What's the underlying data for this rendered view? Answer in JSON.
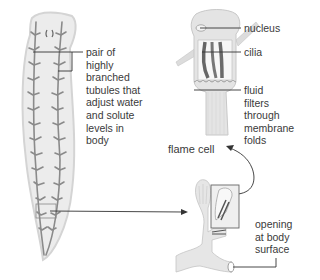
{
  "diagram": {
    "labels": {
      "tubules": "pair of\nhighly\nbranched\ntubules that\nadjust water\nand solute\nlevels in\nbody",
      "nucleus": "nucleus",
      "cilia": "cilia",
      "fluid": "fluid\nfilters\nthrough\nmembrane\nfolds",
      "flame_cell": "flame cell",
      "opening": "opening\nat body\nsurface"
    },
    "colors": {
      "body_fill": "#ececec",
      "body_outline": "#d0d0d0",
      "tubule": "#8a8a8a",
      "leader_line": "#333333",
      "cell_fill": "#e2e2e2",
      "cilia": "#6a6a6a"
    }
  }
}
